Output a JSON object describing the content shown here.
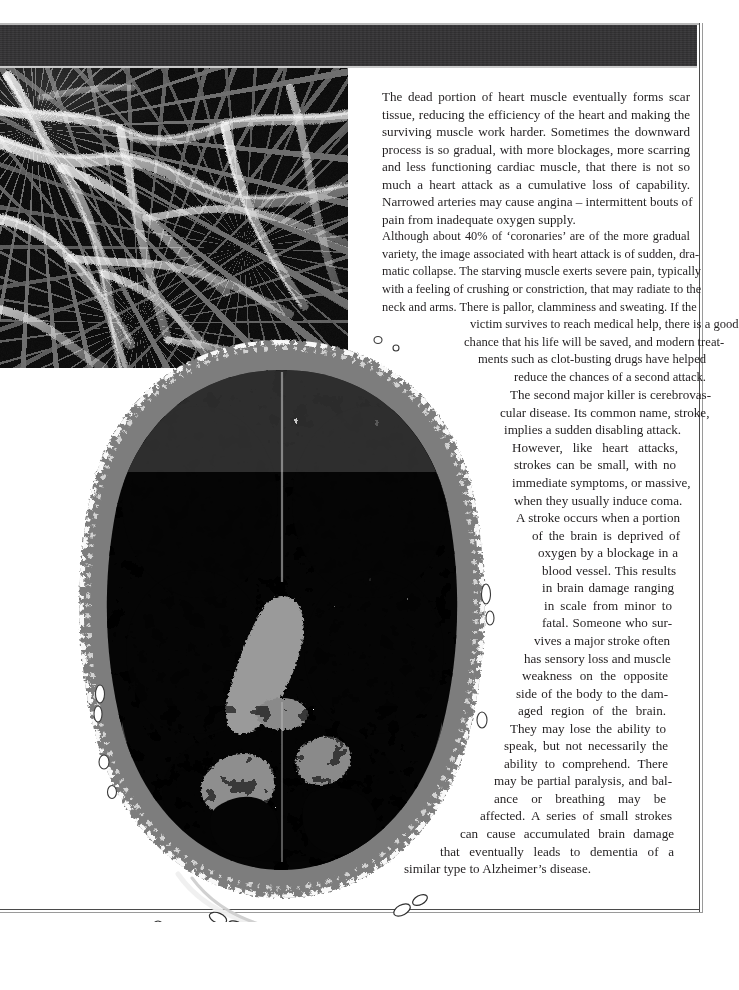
{
  "page": {
    "width": 739,
    "height": 990,
    "background_color": "#ffffff",
    "header_band_color": "#333234",
    "text_color": "#221f20",
    "border_color": "#4a4a4a"
  },
  "images": {
    "micrograph": {
      "name": "scanning-electron-micrograph-of-fibres",
      "description": "Grayscale scanning electron micrograph showing pale branching fibrous strands over a dark background",
      "palette": [
        "#0a0a0a",
        "#2a2a2a",
        "#8f8f8f",
        "#d8d8d8",
        "#f2f2f2"
      ]
    },
    "brain_scan": {
      "name": "brain-ct-scan-axial-slice",
      "description": "Posterised axial brain scan slice, black interior with white speckled tissue, mid-grey skull ring and grey ventricles",
      "palette": [
        "#000000",
        "#7d7d7d",
        "#b4b4b4",
        "#ffffff"
      ]
    }
  },
  "body_text": {
    "paragraphs": [
      {
        "id": "para-scar-tissue",
        "lines": [
          "The dead portion of heart muscle eventually forms scar",
          "tissue, reducing the efficiency of the heart and making the",
          "surviving muscle work harder. Sometimes the downward",
          "process is so gradual, with more blockages, more scarring",
          "and less functioning cardiac muscle, that there is not so",
          "much a heart attack as a cumulative loss of capability.",
          "Narrowed arteries may cause angina – intermittent bouts of",
          "pain from inadequate oxygen supply."
        ],
        "full_text": "The dead portion of heart muscle eventually forms scar tissue, reducing the efficiency of the heart and making the surviving muscle work harder. Sometimes the downward process is so gradual, with more blockages, more scarring and less functioning cardiac muscle, that there is not so much a heart attack as a cumulative loss of capability. Narrowed arteries may cause angina – intermittent bouts of pain from inadequate oxygen supply."
      },
      {
        "id": "para-coronaries",
        "lines": [
          "Although about 40% of ‘coronaries’ are of the more gradual",
          "variety, the image associated with heart attack is of sudden, dra-",
          "matic collapse. The starving muscle exerts severe pain, typically",
          "with a feeling of crushing or constriction, that may radiate to the",
          "neck and arms. There is pallor, clamminess and sweating. If the",
          "victim survives to reach medical help, there is a good",
          "chance that his life will be saved, and modern treat-",
          "ments such as clot-busting drugs have helped",
          "reduce the chances of a second attack."
        ],
        "full_text": "Although about 40% of ‘coronaries’ are of the more gradual variety, the image associated with heart attack is of sudden, dramatic collapse. The starving muscle exerts severe pain, typically with a feeling of crushing or constriction, that may radiate to the neck and arms. There is pallor, clamminess and sweating. If the victim survives to reach medical help, there is a good chance that his life will be saved, and modern treatments such as clot-busting drugs have helped reduce the chances of a second attack."
      },
      {
        "id": "para-cerebrovascular",
        "lines": [
          "The second major killer is cerebrovas-",
          "cular disease. Its common name, stroke,",
          "implies a sudden disabling attack.",
          "However, like heart attacks,",
          "strokes can be small, with no",
          "immediate symptoms, or massive,",
          "when they usually induce coma.",
          "A stroke occurs when a portion",
          "of the brain is deprived of",
          "oxygen by a blockage in a",
          "blood vessel. This results",
          "in brain damage ranging",
          "in scale from minor to",
          "fatal. Someone who sur-",
          "vives a major stroke often",
          "has sensory loss and muscle",
          "weakness on the opposite",
          "side of the body to the dam-",
          "aged region of the brain.",
          "They may lose the ability to",
          "speak, but not necessarily the",
          "ability to comprehend. There",
          "may be partial paralysis, and bal-",
          "ance or breathing may be",
          "affected. A series of small strokes",
          "can cause accumulated brain damage",
          "that eventually leads to dementia of a",
          "similar type to Alzheimer’s disease."
        ],
        "full_text": "The second major killer is cerebrovascular disease. Its common name, stroke, implies a sudden disabling attack. However, like heart attacks, strokes can be small, with no immediate symptoms, or massive, when they usually induce coma. A stroke occurs when a portion of the brain is deprived of oxygen by a blockage in a blood vessel. This results in brain damage ranging in scale from minor to fatal. Someone who survives a major stroke often has sensory loss and muscle weakness on the opposite side of the body to the damaged region of the brain. They may lose the ability to speak, but not necessarily the ability to comprehend. There may be partial paralysis, and balance or breathing may be affected. A series of small strokes can cause accumulated brain damage that eventually leads to dementia of a similar type to Alzheimer’s disease."
      }
    ]
  }
}
